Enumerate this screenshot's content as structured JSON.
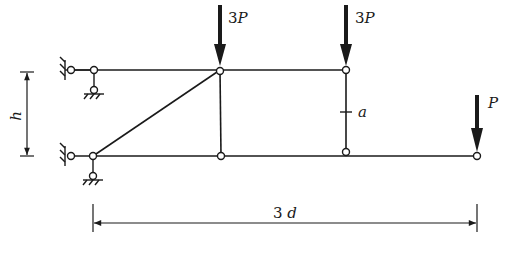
{
  "diagram": {
    "type": "truss-structure",
    "colors": {
      "line": "#1a1a1a",
      "background": "#ffffff"
    },
    "loads": [
      {
        "id": "load-1",
        "label_num": "3",
        "label_var": "P",
        "x": 220
      },
      {
        "id": "load-2",
        "label_num": "3",
        "label_var": "P",
        "x": 346
      },
      {
        "id": "load-3",
        "label_num": "",
        "label_var": "P",
        "x": 477
      }
    ],
    "members": {
      "marked_member_label": "a"
    },
    "dimensions": {
      "height_label": "h",
      "span_label_num": "3",
      "span_label_var": "d"
    }
  }
}
